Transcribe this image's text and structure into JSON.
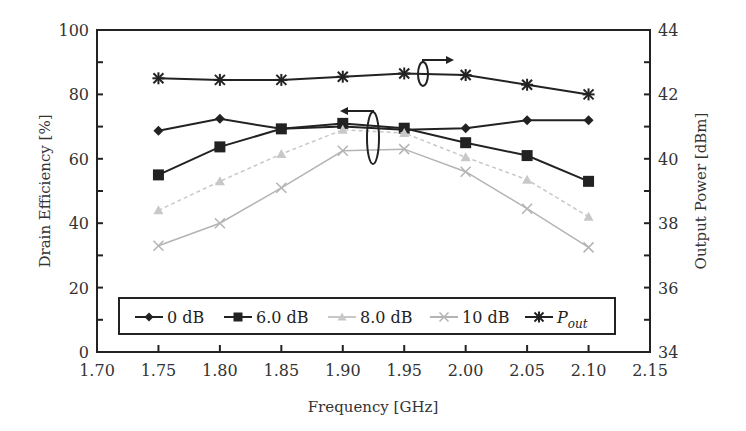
{
  "chart_data": {
    "type": "line",
    "title": "",
    "xlabel": "Frequency [GHz]",
    "ylabel": "Drain Efficiency [%]",
    "ylabel_right": "Output Power [dBm]",
    "xlim": [
      1.7,
      2.15
    ],
    "ylim": [
      0,
      100
    ],
    "ylim_right": [
      34,
      44
    ],
    "x_ticks": [
      "1.70",
      "1.75",
      "1.80",
      "1.85",
      "1.90",
      "1.95",
      "2.00",
      "2.05",
      "2.10",
      "2.15"
    ],
    "y_ticks": [
      "0",
      "20",
      "40",
      "60",
      "80",
      "100"
    ],
    "y_ticks_right": [
      "34",
      "36",
      "38",
      "40",
      "42",
      "44"
    ],
    "grid": false,
    "legend_position": "bottom-inside",
    "x": [
      1.75,
      1.8,
      1.85,
      1.9,
      1.95,
      2.0,
      2.05,
      2.1
    ],
    "series": [
      {
        "name": "0 dB",
        "axis": "left",
        "marker": "diamond",
        "color": "#222222",
        "values": [
          68.7,
          72.4,
          69.3,
          70.0,
          69.0,
          69.5,
          72.0,
          72.0
        ]
      },
      {
        "name": "6.0 dB",
        "axis": "left",
        "marker": "square",
        "color": "#222222",
        "values": [
          55.0,
          63.7,
          69.3,
          71.0,
          69.5,
          65.0,
          61.0,
          53.0
        ]
      },
      {
        "name": "8.0 dB",
        "axis": "left",
        "marker": "triangle",
        "color": "#c8c8c8",
        "values": [
          44.0,
          53.0,
          61.5,
          69.0,
          68.0,
          60.5,
          53.5,
          42.0
        ]
      },
      {
        "name": "10 dB",
        "axis": "left",
        "marker": "x",
        "color": "#b4b4b4",
        "values": [
          33.0,
          40.0,
          51.0,
          62.5,
          63.0,
          56.0,
          44.5,
          32.5
        ]
      },
      {
        "name": "Pout",
        "axis": "right",
        "marker": "star",
        "color": "#222222",
        "values": [
          42.5,
          42.45,
          42.45,
          42.55,
          42.65,
          42.6,
          42.3,
          42.0
        ]
      }
    ],
    "annotations": [
      {
        "type": "ellipse-arrow",
        "points_to": "left axis",
        "near_x": 1.93
      },
      {
        "type": "ellipse-arrow",
        "points_to": "right axis",
        "near_x": 1.96
      }
    ]
  },
  "legend": {
    "items": [
      "0 dB",
      "6.0 dB",
      "8.0 dB",
      "10 dB"
    ],
    "pout_main": "P",
    "pout_sub": "out"
  }
}
